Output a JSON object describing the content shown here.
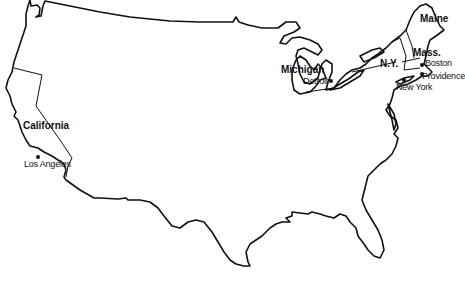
{
  "map": {
    "title": "United States outline map",
    "states": [
      {
        "id": "maine",
        "label": "Maine"
      },
      {
        "id": "mass",
        "label": "Mass."
      },
      {
        "id": "ny",
        "label": "N.Y."
      },
      {
        "id": "michigan",
        "label": "Michigan"
      },
      {
        "id": "california",
        "label": "California"
      }
    ],
    "cities": [
      {
        "id": "boston",
        "label": "Boston"
      },
      {
        "id": "providence",
        "label": "Providence"
      },
      {
        "id": "new-york",
        "label": "New York"
      },
      {
        "id": "detroit",
        "label": "Detroit"
      },
      {
        "id": "los-angeles",
        "label": "Los Angeles"
      }
    ],
    "colors": {
      "line": "#111111",
      "background": "#ffffff"
    }
  }
}
